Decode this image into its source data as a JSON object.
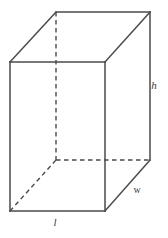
{
  "figure": {
    "name": "rectangular-prism",
    "background_color": "#ffffff",
    "line_color": "#4a4a4a",
    "label_color": "#3d3d3d"
  },
  "labels": {
    "height": "h",
    "width": "w",
    "length": "l"
  },
  "geometry": {
    "front_face": {
      "top_left": [
        10,
        62
      ],
      "top_right": [
        105,
        62
      ],
      "bottom_right": [
        105,
        211
      ],
      "bottom_left": [
        10,
        211
      ]
    },
    "back_face": {
      "top_left": [
        56,
        12
      ],
      "top_right": [
        150,
        12
      ],
      "bottom_right": [
        150,
        160
      ],
      "bottom_left": [
        56,
        160
      ]
    },
    "hidden_edges": [
      "back-top-left-to-back-bottom-left",
      "back-bottom-left-to-back-bottom-right",
      "back-bottom-left-to-front-bottom-left"
    ],
    "label_positions": {
      "height": [
        154,
        85
      ],
      "width": [
        137,
        190
      ],
      "length": [
        55,
        222
      ]
    }
  }
}
